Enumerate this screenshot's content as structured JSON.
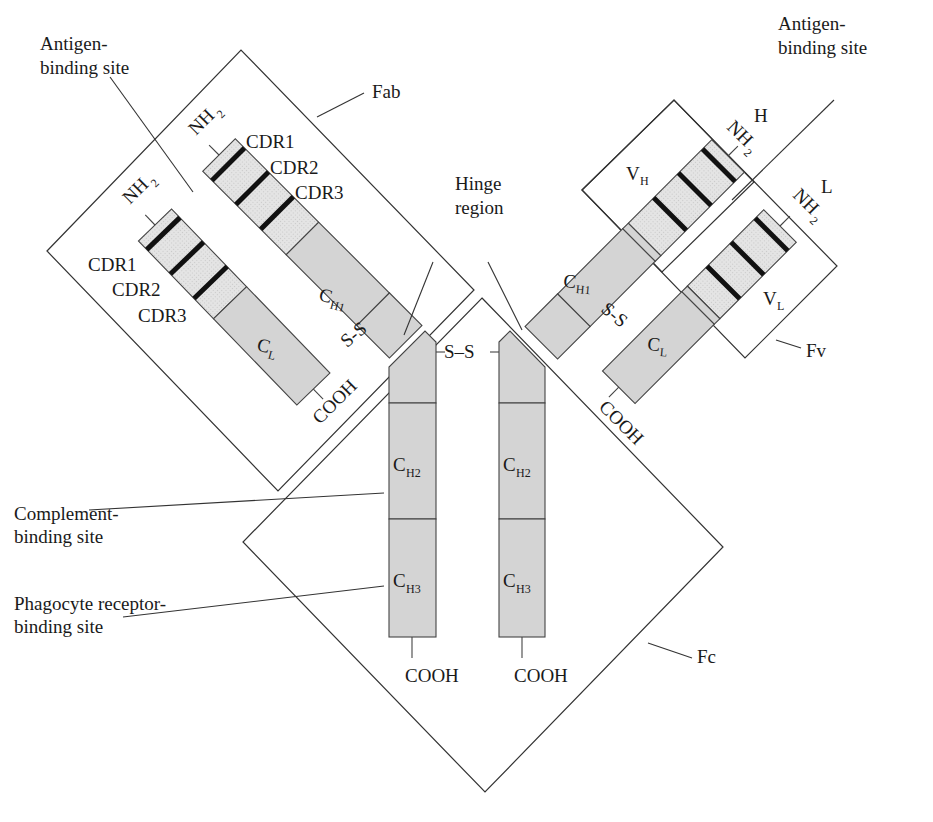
{
  "diagram": {
    "colors": {
      "constant_domain": "#d4d4d4",
      "variable_domain": "#e2e2e2",
      "cdr_band": "#111111",
      "outline": "#333333"
    },
    "labels": {
      "antigen_binding_left_l1": "Antigen-",
      "antigen_binding_left_l2": "binding site",
      "antigen_binding_right_l1": "Antigen-",
      "antigen_binding_right_l2": "binding site",
      "fab": "Fab",
      "fv": "Fv",
      "fc": "Fc",
      "hinge_l1": "Hinge",
      "hinge_l2": "region",
      "complement_l1": "Complement-",
      "complement_l2": "binding site",
      "phagocyte_l1": "Phagocyte receptor-",
      "phagocyte_l2": "binding site",
      "heavy_chain": "H",
      "light_chain": "L",
      "nh2": "NH",
      "nh2_sub": "2",
      "cooh": "COOH",
      "ss": "S–S",
      "ss_small": "S-S",
      "cdr1": "CDR1",
      "cdr2": "CDR2",
      "cdr3": "CDR3",
      "c": "C",
      "v": "V",
      "ch1_sub": "H1",
      "ch2_sub": "H2",
      "ch3_sub": "H3",
      "cl_sub": "L",
      "vh_sub": "H",
      "vl_sub": "L"
    }
  }
}
